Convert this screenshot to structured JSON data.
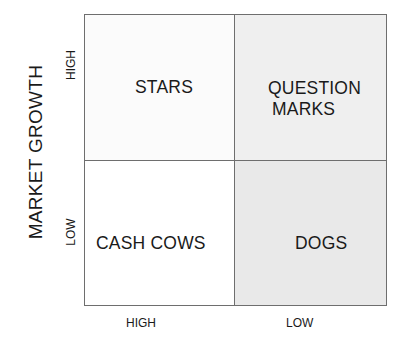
{
  "diagram": {
    "type": "2x2 matrix",
    "y_axis": {
      "title": "MARKET GROWTH",
      "ticks": [
        "HIGH",
        "LOW"
      ]
    },
    "x_axis": {
      "title": "",
      "ticks": [
        "HIGH",
        "LOW"
      ]
    },
    "quadrants": {
      "top_left": {
        "label_lines": [
          "STARS"
        ],
        "fill": "#fbfbfb"
      },
      "top_right": {
        "label_lines": [
          "QUESTION",
          "MARKS"
        ],
        "fill": "#efefef"
      },
      "bottom_left": {
        "label_lines": [
          "CASH COWS"
        ],
        "fill": "#ffffff"
      },
      "bottom_right": {
        "label_lines": [
          "DOGS"
        ],
        "fill": "#e9e9e9"
      }
    },
    "border_color": "#6e6e6e"
  }
}
